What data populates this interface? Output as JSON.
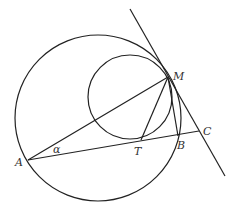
{
  "diagram": {
    "type": "geometry",
    "stroke_color": "#222222",
    "label_color": "#333333",
    "circles": [
      {
        "name": "large-circle",
        "cx": 98,
        "cy": 118,
        "r": 83
      },
      {
        "name": "small-circle",
        "cx": 130,
        "cy": 97,
        "r": 42
      }
    ],
    "points": {
      "A": {
        "x": 28,
        "y": 160
      },
      "M": {
        "x": 168,
        "y": 77
      },
      "T": {
        "x": 141,
        "y": 140
      },
      "B": {
        "x": 178,
        "y": 136
      },
      "C": {
        "x": 199,
        "y": 131
      }
    },
    "labels": {
      "A": "A",
      "M": "M",
      "T": "T",
      "B": "B",
      "C": "C",
      "alpha": "α"
    },
    "segments": [
      {
        "name": "segment-AM",
        "from": "A",
        "to": "M"
      },
      {
        "name": "segment-AC",
        "from": "A",
        "to": "C"
      },
      {
        "name": "segment-MT",
        "from": "M",
        "to": "T"
      },
      {
        "name": "segment-MB",
        "from": "M",
        "to": "B"
      }
    ],
    "tangent_line": {
      "x1": 130,
      "y1": 9,
      "x2": 225,
      "y2": 176
    }
  }
}
